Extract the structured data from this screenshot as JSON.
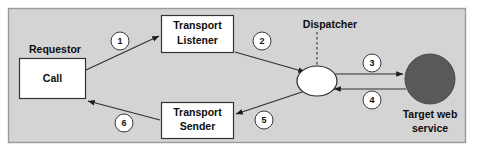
{
  "diagram": {
    "frame": {
      "background_color": "#d4d4d4",
      "border_color": "#9a9a9a"
    },
    "nodes": [
      {
        "id": "requestor",
        "kind": "group-label",
        "label": "Requestor",
        "shape": "text"
      },
      {
        "id": "call",
        "kind": "process-box",
        "label": "Call",
        "shape": "rectangle",
        "fill": "#ffffff",
        "stroke": "#333333"
      },
      {
        "id": "transport-listener",
        "kind": "process-box",
        "label_line1": "Transport",
        "label_line2": "Listener",
        "shape": "rectangle",
        "fill": "#ffffff",
        "stroke": "#333333"
      },
      {
        "id": "transport-sender",
        "kind": "process-box",
        "label_line1": "Transport",
        "label_line2": "Sender",
        "shape": "rectangle",
        "fill": "#ffffff",
        "stroke": "#333333"
      },
      {
        "id": "dispatcher",
        "kind": "component",
        "label": "Dispatcher",
        "shape": "ellipse",
        "fill": "#ffffff",
        "stroke": "#2b2b2b"
      },
      {
        "id": "target-web-service",
        "kind": "endpoint",
        "label_line1": "Target web",
        "label_line2": "service",
        "shape": "circle",
        "fill": "#595959",
        "stroke": "#4a4a4a"
      }
    ],
    "sequence_steps": [
      {
        "number": "1",
        "from": "call",
        "to": "transport-listener"
      },
      {
        "number": "2",
        "from": "transport-listener",
        "to": "dispatcher"
      },
      {
        "number": "3",
        "from": "dispatcher",
        "to": "target-web-service"
      },
      {
        "number": "4",
        "from": "target-web-service",
        "to": "dispatcher"
      },
      {
        "number": "5",
        "from": "dispatcher",
        "to": "transport-sender"
      },
      {
        "number": "6",
        "from": "transport-sender",
        "to": "call"
      }
    ]
  }
}
